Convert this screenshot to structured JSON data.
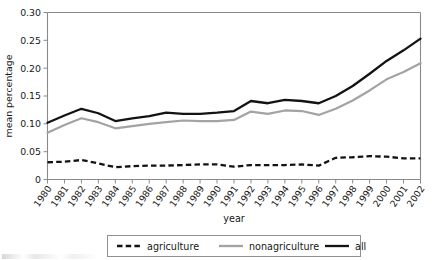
{
  "chart_data": {
    "type": "line",
    "title": "",
    "xlabel": "year",
    "ylabel": "mean percentage",
    "ylim": [
      0,
      0.3
    ],
    "yticks": [
      "0",
      "0.05",
      "0.10",
      "0.15",
      "0.20",
      "0.25",
      "0.30"
    ],
    "ytick_values": [
      0,
      0.05,
      0.1,
      0.15,
      0.2,
      0.25,
      0.3
    ],
    "grid": false,
    "legend_position": "bottom-center",
    "categories": [
      "1980",
      "1981",
      "1982",
      "1983",
      "1984",
      "1985",
      "1986",
      "1987",
      "1988",
      "1989",
      "1990",
      "1991",
      "1992",
      "1993",
      "1994",
      "1995",
      "1996",
      "1997",
      "1998",
      "1999",
      "2000",
      "2001",
      "2002"
    ],
    "series": [
      {
        "name": "agriculture",
        "style": "dashed",
        "color": "#131313",
        "values": [
          0.031,
          0.032,
          0.035,
          0.029,
          0.022,
          0.024,
          0.025,
          0.025,
          0.026,
          0.027,
          0.027,
          0.023,
          0.026,
          0.026,
          0.026,
          0.027,
          0.025,
          0.039,
          0.04,
          0.042,
          0.041,
          0.038,
          0.038
        ]
      },
      {
        "name": "nonagriculture",
        "style": "solid",
        "color": "#a3a3a3",
        "values": [
          0.084,
          0.098,
          0.11,
          0.103,
          0.092,
          0.096,
          0.1,
          0.103,
          0.106,
          0.105,
          0.105,
          0.107,
          0.122,
          0.118,
          0.124,
          0.123,
          0.116,
          0.127,
          0.142,
          0.16,
          0.18,
          0.193,
          0.209
        ]
      },
      {
        "name": "all",
        "style": "solid",
        "color": "#131313",
        "values": [
          0.102,
          0.115,
          0.127,
          0.119,
          0.105,
          0.11,
          0.114,
          0.12,
          0.118,
          0.118,
          0.12,
          0.123,
          0.141,
          0.137,
          0.143,
          0.141,
          0.137,
          0.15,
          0.168,
          0.19,
          0.213,
          0.232,
          0.253
        ]
      }
    ],
    "legend_entries": [
      {
        "label": "agriculture",
        "style": "dashed",
        "color": "#131313"
      },
      {
        "label": "nonagriculture",
        "style": "solid",
        "color": "#a3a3a3"
      },
      {
        "label": "all",
        "style": "solid",
        "color": "#131313"
      }
    ]
  }
}
